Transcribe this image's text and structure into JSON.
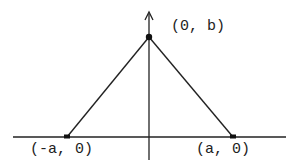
{
  "diagram": {
    "type": "triangle-on-axes",
    "labels": {
      "apex": "(0, b)",
      "left": "(-a, 0)",
      "right": "(a, 0)"
    },
    "colors": {
      "stroke": "#222222",
      "background": "#ffffff"
    }
  }
}
